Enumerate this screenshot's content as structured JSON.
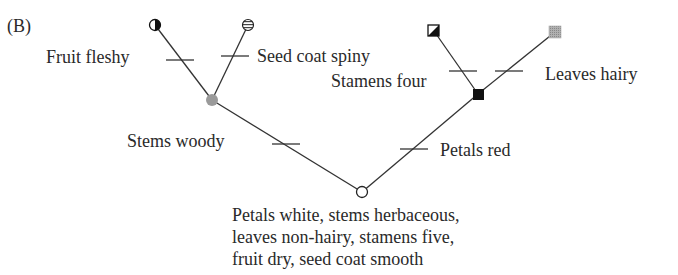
{
  "panel_label": "(B)",
  "tree": {
    "root": {
      "description_lines": [
        "Petals white, stems herbaceous,",
        "leaves non-hairy, stamens five,",
        "fruit dry, seed coat smooth"
      ],
      "symbol": "open-circle"
    },
    "internal_nodes": [
      {
        "id": "woody-clade",
        "symbol": "gray-circle"
      },
      {
        "id": "red-clade",
        "symbol": "black-square"
      }
    ],
    "leaves": [
      {
        "id": "leaf-1",
        "symbol": "half-black-circle"
      },
      {
        "id": "leaf-2",
        "symbol": "striped-circle"
      },
      {
        "id": "leaf-3",
        "symbol": "diagonal-half-square"
      },
      {
        "id": "leaf-4",
        "symbol": "gray-square"
      }
    ],
    "character_changes": {
      "fruit_fleshy": "Fruit fleshy",
      "seed_coat_spiny": "Seed coat spiny",
      "stems_woody": "Stems woody",
      "stamens_four": "Stamens four",
      "leaves_hairy": "Leaves hairy",
      "petals_red": "Petals red"
    }
  },
  "colors": {
    "line": "#333333",
    "gray_node": "#9a9a9a",
    "black_node": "#111111"
  }
}
